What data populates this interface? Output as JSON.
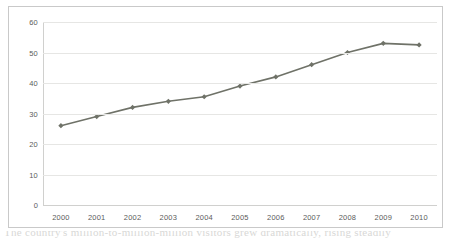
{
  "chart_data": {
    "type": "line",
    "title": "",
    "subtitle": "",
    "xlabel": "",
    "ylabel": "",
    "categories": [
      "2000",
      "2001",
      "2002",
      "2003",
      "2004",
      "2005",
      "2006",
      "2007",
      "2008",
      "2009",
      "2010"
    ],
    "values": [
      26,
      29,
      32,
      34,
      35.5,
      39,
      42,
      46,
      50,
      53,
      52.5
    ],
    "series": [
      {
        "name": "series-1",
        "values": [
          26,
          29,
          32,
          34,
          35.5,
          39,
          42,
          46,
          50,
          53,
          52.5
        ]
      }
    ],
    "ylim": [
      0,
      60
    ],
    "y_ticks": [
      0,
      10,
      20,
      30,
      40,
      50,
      60
    ],
    "y_tick_labels": [
      "0",
      "10",
      "20",
      "30",
      "40",
      "50",
      "60"
    ],
    "x_tick_labels": [
      "2000",
      "2001",
      "2002",
      "2003",
      "2004",
      "2005",
      "2006",
      "2007",
      "2008",
      "2009",
      "2010"
    ],
    "grid": true,
    "grid_axis": "y",
    "legend": false,
    "legend_position": "none",
    "marker": "diamond",
    "annotations": []
  },
  "style": {
    "line_color": "#6f7268",
    "marker_color": "#6f7268",
    "grid_color": "#e6e6e4",
    "axis_color": "#d0d0ce",
    "tick_label_color": "#5b5b5b",
    "border_color": "#c9c9c9",
    "background": "#ffffff"
  },
  "caption": {
    "text": "The country's million-to-million-million visitors grew dramatically, rising steadily"
  }
}
